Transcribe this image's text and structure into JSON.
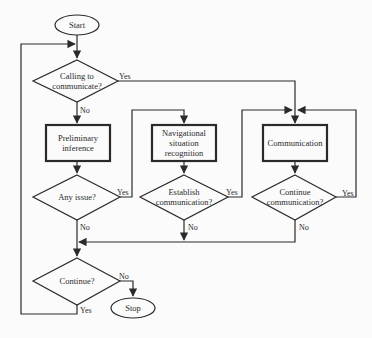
{
  "flowchart": {
    "nodes": {
      "start": {
        "type": "terminal",
        "label": "Start"
      },
      "calling": {
        "type": "decision",
        "lines": [
          "Calling to",
          "communicate?"
        ]
      },
      "preliminary": {
        "type": "process",
        "lines": [
          "Preliminary",
          "inference"
        ]
      },
      "navigational": {
        "type": "process",
        "lines": [
          "Navigational",
          "situation",
          "recognition"
        ]
      },
      "communication": {
        "type": "process",
        "lines": [
          "Communication"
        ]
      },
      "any_issue": {
        "type": "decision",
        "lines": [
          "Any issue?"
        ]
      },
      "establish": {
        "type": "decision",
        "lines": [
          "Establish",
          "communication?"
        ]
      },
      "continue_comm": {
        "type": "decision",
        "lines": [
          "Continue",
          "communication?"
        ]
      },
      "continue": {
        "type": "decision",
        "lines": [
          "Continue?"
        ]
      },
      "stop": {
        "type": "terminal",
        "label": "Stop"
      }
    },
    "edge_labels": {
      "calling_yes": "Yes",
      "calling_no": "No",
      "any_issue_yes": "Yes",
      "any_issue_no": "No",
      "establish_yes": "Yes",
      "establish_no": "No",
      "continue_comm_yes": "Yes",
      "continue_comm_no": "No",
      "continue_no": "No",
      "continue_yes": "Yes"
    },
    "colors": {
      "stroke": "#2a2a2a",
      "background": "#fbfbfb"
    }
  }
}
